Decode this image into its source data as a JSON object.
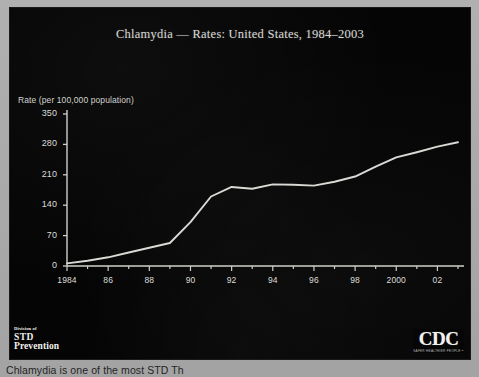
{
  "slide": {
    "title": "Chlamydia — Rates: United States, 1984–2003",
    "y_axis_label": "Rate (per 100,000 population)"
  },
  "logos": {
    "std": {
      "division_of": "Division of",
      "line1": "STD",
      "line2": "Prevention"
    },
    "cdc": {
      "wordmark": "CDC",
      "tagline": "SAFER·HEALTHIER·PEOPLE™"
    }
  },
  "caption": "Chlamydia is one of the most                  STD   Th",
  "chart_data": {
    "type": "line",
    "title": "Chlamydia — Rates: United States, 1984–2003",
    "xlabel": "",
    "ylabel": "Rate (per 100,000 population)",
    "ylim": [
      0,
      350
    ],
    "yticks": [
      0,
      70,
      140,
      210,
      280,
      350
    ],
    "ytick_labels": [
      "0",
      "70",
      "140",
      "210",
      "280",
      "350"
    ],
    "xlim": [
      1984,
      2003
    ],
    "xticks": [
      1984,
      1986,
      1988,
      1990,
      1992,
      1994,
      1996,
      1998,
      2000,
      2002
    ],
    "xtick_labels": [
      "1984",
      "86",
      "88",
      "90",
      "92",
      "94",
      "96",
      "98",
      "2000",
      "02"
    ],
    "x": [
      1984,
      1985,
      1986,
      1987,
      1988,
      1989,
      1990,
      1991,
      1992,
      1993,
      1994,
      1995,
      1996,
      1997,
      1998,
      1999,
      2000,
      2001,
      2002,
      2003
    ],
    "values": [
      6,
      12,
      20,
      31,
      42,
      53,
      101,
      160,
      182,
      178,
      188,
      187,
      185,
      194,
      206,
      229,
      250,
      262,
      275,
      285
    ],
    "line_color": "#d9d9d5",
    "grid": false,
    "legend": false
  }
}
